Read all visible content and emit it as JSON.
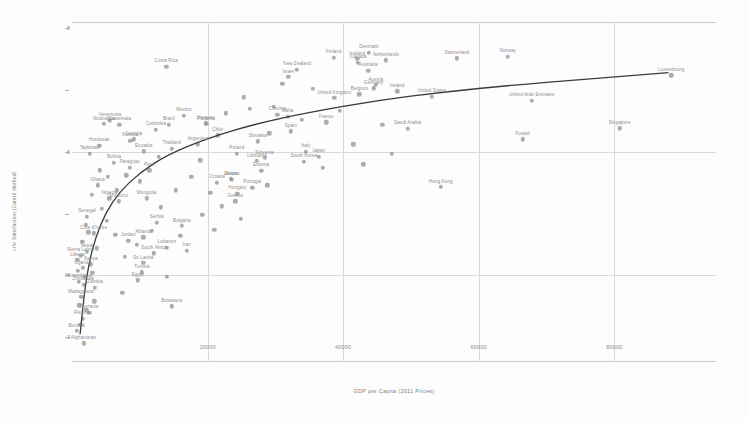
{
  "chart_data": {
    "type": "scatter",
    "title": "",
    "xlabel": "GDP per Capita (2011 Prices)",
    "ylabel": "Life Satisfaction (Cantril Method)",
    "xlim": [
      0,
      95000
    ],
    "ylim": [
      2.6,
      8.1
    ],
    "xticks": [
      20000,
      40000,
      60000,
      80000
    ],
    "xticklabels": [
      "20000",
      "40000",
      "60000",
      "80000"
    ],
    "yticks": [
      3,
      4,
      5,
      6,
      7,
      8
    ],
    "yticklabels": [
      "3",
      "4",
      "5",
      "6",
      "7",
      "8"
    ],
    "grid": true,
    "legend": false,
    "point_color": "#9a9a9a",
    "trend_color": "#3a3a3a",
    "grid_color": "#d9d9d9",
    "label_color": "#8d8d8d",
    "trendline": {
      "type": "logarithmic",
      "description": "fitted log curve rising steeply at low GDP then flattening",
      "points": [
        [
          1200,
          3.05
        ],
        [
          1800,
          3.7
        ],
        [
          2500,
          4.2
        ],
        [
          3500,
          4.62
        ],
        [
          5000,
          5.02
        ],
        [
          7000,
          5.35
        ],
        [
          10000,
          5.66
        ],
        [
          14000,
          5.95
        ],
        [
          20000,
          6.22
        ],
        [
          27000,
          6.45
        ],
        [
          35000,
          6.64
        ],
        [
          45000,
          6.83
        ],
        [
          55000,
          6.97
        ],
        [
          65000,
          7.08
        ],
        [
          75000,
          7.17
        ],
        [
          88000,
          7.28
        ]
      ]
    },
    "points": [
      {
        "name": "Costa Rica",
        "x": 13900,
        "y": 7.38
      },
      {
        "name": "New Zealand",
        "x": 33200,
        "y": 7.33
      },
      {
        "name": "Denmark",
        "x": 43800,
        "y": 7.6
      },
      {
        "name": "Finland",
        "x": 38600,
        "y": 7.52
      },
      {
        "name": "Netherlands",
        "x": 46300,
        "y": 7.48
      },
      {
        "name": "Canada",
        "x": 42200,
        "y": 7.44
      },
      {
        "name": "Australia",
        "x": 43700,
        "y": 7.31
      },
      {
        "name": "Iceland",
        "x": 42100,
        "y": 7.5
      },
      {
        "name": "Switzerland",
        "x": 56800,
        "y": 7.51
      },
      {
        "name": "Norway",
        "x": 64300,
        "y": 7.54
      },
      {
        "name": "United Kingdom",
        "x": 38700,
        "y": 6.87
      },
      {
        "name": "Germany",
        "x": 44500,
        "y": 7.03
      },
      {
        "name": "Austria",
        "x": 44800,
        "y": 7.08
      },
      {
        "name": "Ireland",
        "x": 48000,
        "y": 6.98
      },
      {
        "name": "Belgium",
        "x": 42400,
        "y": 6.93
      },
      {
        "name": "United States",
        "x": 53100,
        "y": 6.89
      },
      {
        "name": "United Arab Emirates",
        "x": 67800,
        "y": 6.83
      },
      {
        "name": "Luxembourg",
        "x": 88400,
        "y": 7.24
      },
      {
        "name": "Singapore",
        "x": 80800,
        "y": 6.38
      },
      {
        "name": "Kuwait",
        "x": 66500,
        "y": 6.2
      },
      {
        "name": "Hong Kong",
        "x": 54400,
        "y": 5.43
      },
      {
        "name": "Malta",
        "x": 31800,
        "y": 6.57
      },
      {
        "name": "France",
        "x": 37500,
        "y": 6.48
      },
      {
        "name": "Spain",
        "x": 32300,
        "y": 6.33
      },
      {
        "name": "Israel",
        "x": 31900,
        "y": 7.21
      },
      {
        "name": "Italy",
        "x": 34500,
        "y": 6.0
      },
      {
        "name": "Japan",
        "x": 36400,
        "y": 5.92
      },
      {
        "name": "Saudi Arabia",
        "x": 49500,
        "y": 6.37
      },
      {
        "name": "South Korea",
        "x": 34200,
        "y": 5.84
      },
      {
        "name": "Slovakia",
        "x": 27400,
        "y": 6.17
      },
      {
        "name": "Poland",
        "x": 24300,
        "y": 5.97
      },
      {
        "name": "Slovenia",
        "x": 28400,
        "y": 5.9
      },
      {
        "name": "Czechia",
        "x": 30300,
        "y": 6.6
      },
      {
        "name": "Hungary",
        "x": 24400,
        "y": 5.32
      },
      {
        "name": "Lithuania",
        "x": 27300,
        "y": 5.85
      },
      {
        "name": "Estonia",
        "x": 27900,
        "y": 5.69
      },
      {
        "name": "Latvia",
        "x": 23400,
        "y": 5.56
      },
      {
        "name": "Portugal",
        "x": 26600,
        "y": 5.42
      },
      {
        "name": "Greece",
        "x": 24100,
        "y": 5.2
      },
      {
        "name": "Croatia",
        "x": 21400,
        "y": 5.5
      },
      {
        "name": "Russia",
        "x": 23600,
        "y": 5.55
      },
      {
        "name": "Panama",
        "x": 19800,
        "y": 6.45
      },
      {
        "name": "Chile",
        "x": 21500,
        "y": 6.27
      },
      {
        "name": "Mexico",
        "x": 16500,
        "y": 6.58
      },
      {
        "name": "Brazil",
        "x": 14300,
        "y": 6.44
      },
      {
        "name": "Argentina",
        "x": 18600,
        "y": 6.12
      },
      {
        "name": "Uruguay",
        "x": 19700,
        "y": 6.46
      },
      {
        "name": "Colombia",
        "x": 12400,
        "y": 6.36
      },
      {
        "name": "Nicaragua",
        "x": 4700,
        "y": 6.45
      },
      {
        "name": "Guatemala",
        "x": 7000,
        "y": 6.44
      },
      {
        "name": "Venezuela",
        "x": 5600,
        "y": 6.5
      },
      {
        "name": "Kosovo",
        "x": 8600,
        "y": 6.18
      },
      {
        "name": "Georgia",
        "x": 9100,
        "y": 6.2
      },
      {
        "name": "Honduras",
        "x": 4000,
        "y": 6.1
      },
      {
        "name": "Tajikistan",
        "x": 2600,
        "y": 5.97
      },
      {
        "name": "Thailand",
        "x": 14700,
        "y": 6.05
      },
      {
        "name": "Ecuador",
        "x": 10600,
        "y": 6.01
      },
      {
        "name": "Peru",
        "x": 11400,
        "y": 5.7
      },
      {
        "name": "Bolivia",
        "x": 6200,
        "y": 5.82
      },
      {
        "name": "Paraguay",
        "x": 8500,
        "y": 5.74
      },
      {
        "name": "Ghana",
        "x": 3800,
        "y": 5.46
      },
      {
        "name": "Nigeria",
        "x": 5500,
        "y": 5.25
      },
      {
        "name": "Morocco",
        "x": 6900,
        "y": 5.2
      },
      {
        "name": "Mongolia",
        "x": 11000,
        "y": 5.25
      },
      {
        "name": "Senegal",
        "x": 2200,
        "y": 4.95
      },
      {
        "name": "Côte d'Ivoire",
        "x": 3200,
        "y": 4.68
      },
      {
        "name": "Serbia",
        "x": 12500,
        "y": 4.85
      },
      {
        "name": "Bulgaria",
        "x": 16200,
        "y": 4.8
      },
      {
        "name": "Albania",
        "x": 10500,
        "y": 4.62
      },
      {
        "name": "Jordan",
        "x": 8300,
        "y": 4.56
      },
      {
        "name": "Lebanon",
        "x": 14000,
        "y": 4.45
      },
      {
        "name": "Iran",
        "x": 16900,
        "y": 4.4
      },
      {
        "name": "South Africa",
        "x": 12100,
        "y": 4.36
      },
      {
        "name": "Nepal",
        "x": 2200,
        "y": 4.38
      },
      {
        "name": "Sierra Leone",
        "x": 1300,
        "y": 4.32
      },
      {
        "name": "Liberia",
        "x": 800,
        "y": 4.25
      },
      {
        "name": "Sri Lanka",
        "x": 10500,
        "y": 4.2
      },
      {
        "name": "Kenya",
        "x": 2800,
        "y": 4.18
      },
      {
        "name": "Uganda",
        "x": 1600,
        "y": 4.12
      },
      {
        "name": "Tunisia",
        "x": 10300,
        "y": 4.05
      },
      {
        "name": "Egypt",
        "x": 9700,
        "y": 3.92
      },
      {
        "name": "Mozambique",
        "x": 1000,
        "y": 3.9
      },
      {
        "name": "Zimbabwe",
        "x": 1700,
        "y": 3.85
      },
      {
        "name": "Zambia",
        "x": 3400,
        "y": 3.8
      },
      {
        "name": "Madagascar",
        "x": 1350,
        "y": 3.65
      },
      {
        "name": "Botswana",
        "x": 14700,
        "y": 3.5
      },
      {
        "name": "Tanzania",
        "x": 2500,
        "y": 3.4
      },
      {
        "name": "Rwanda",
        "x": 1600,
        "y": 3.3
      },
      {
        "name": "Burundi",
        "x": 700,
        "y": 3.1
      },
      {
        "name": "Afghanistan",
        "x": 1700,
        "y": 2.9
      }
    ],
    "extra_points": [
      {
        "x": 31000,
        "y": 7.1
      },
      {
        "x": 35500,
        "y": 7.02
      },
      {
        "x": 29800,
        "y": 6.73
      },
      {
        "x": 26200,
        "y": 6.7
      },
      {
        "x": 39500,
        "y": 6.66
      },
      {
        "x": 45800,
        "y": 6.44
      },
      {
        "x": 41500,
        "y": 6.12
      },
      {
        "x": 47200,
        "y": 5.97
      },
      {
        "x": 33900,
        "y": 6.52
      },
      {
        "x": 29100,
        "y": 6.3
      },
      {
        "x": 22700,
        "y": 6.62
      },
      {
        "x": 25300,
        "y": 6.88
      },
      {
        "x": 18900,
        "y": 5.86
      },
      {
        "x": 20400,
        "y": 5.34
      },
      {
        "x": 22100,
        "y": 5.12
      },
      {
        "x": 24900,
        "y": 4.92
      },
      {
        "x": 17600,
        "y": 5.6
      },
      {
        "x": 15300,
        "y": 5.38
      },
      {
        "x": 13100,
        "y": 5.1
      },
      {
        "x": 11800,
        "y": 4.72
      },
      {
        "x": 9600,
        "y": 4.5
      },
      {
        "x": 7800,
        "y": 4.3
      },
      {
        "x": 6400,
        "y": 4.66
      },
      {
        "x": 5100,
        "y": 4.88
      },
      {
        "x": 4400,
        "y": 5.08
      },
      {
        "x": 3700,
        "y": 4.44
      },
      {
        "x": 3000,
        "y": 4.04
      },
      {
        "x": 2400,
        "y": 4.7
      },
      {
        "x": 1900,
        "y": 3.98
      },
      {
        "x": 1500,
        "y": 4.54
      },
      {
        "x": 1100,
        "y": 3.52
      },
      {
        "x": 900,
        "y": 4.08
      },
      {
        "x": 19200,
        "y": 4.98
      },
      {
        "x": 16000,
        "y": 4.64
      },
      {
        "x": 12800,
        "y": 5.92
      },
      {
        "x": 10000,
        "y": 5.52
      },
      {
        "x": 8000,
        "y": 5.62
      },
      {
        "x": 6600,
        "y": 5.38
      },
      {
        "x": 5300,
        "y": 5.6
      },
      {
        "x": 4100,
        "y": 5.7
      },
      {
        "x": 2900,
        "y": 5.3
      },
      {
        "x": 2000,
        "y": 4.82
      },
      {
        "x": 37000,
        "y": 5.74
      },
      {
        "x": 43000,
        "y": 5.8
      },
      {
        "x": 28800,
        "y": 5.46
      },
      {
        "x": 21000,
        "y": 4.74
      },
      {
        "x": 14000,
        "y": 3.98
      },
      {
        "x": 7400,
        "y": 3.72
      },
      {
        "x": 3300,
        "y": 3.58
      },
      {
        "x": 1250,
        "y": 3.2
      },
      {
        "x": 2100,
        "y": 3.44
      }
    ]
  }
}
